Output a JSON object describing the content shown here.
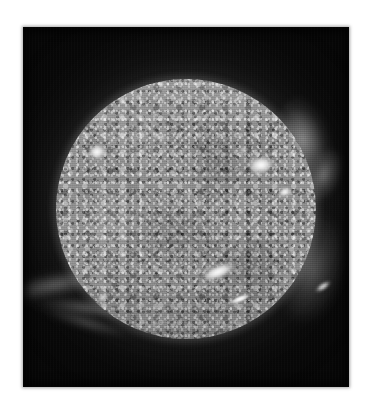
{
  "image": {
    "kind": "solar-disk-photograph",
    "subject": "Sun",
    "rendering": "grayscale",
    "caption": "",
    "frame": {
      "background_color": "#ffffff",
      "plate_color": "#060606",
      "left": 23,
      "top": 27,
      "width": 326,
      "height": 360
    },
    "disk": {
      "label": "solar disk",
      "center_x": 186,
      "center_y": 209,
      "radius": 130,
      "surface_color": "#8e8e8e",
      "limb_color": "#b4b4b4",
      "texture": "granular mottled plasma"
    },
    "corona": {
      "label": "corona",
      "glow_color": "#c8c8c8",
      "sky_color": "#0a0a0a"
    },
    "features": [
      {
        "name": "active-region-west",
        "label": "bright active region (west limb)",
        "x": 97,
        "y": 152,
        "brightness": "#ffffff"
      },
      {
        "name": "active-region-east",
        "label": "bright active region (east)",
        "x": 261,
        "y": 165,
        "brightness": "#ffffff"
      },
      {
        "name": "bright-filament-south",
        "label": "elongated bright filament (south central)",
        "x": 218,
        "y": 272,
        "brightness": "#ffffff"
      },
      {
        "name": "coronal-streamer-southwest",
        "label": "coronal streamer extending off the southwest limb",
        "x": 55,
        "y": 285,
        "brightness": "#b4b4b4"
      },
      {
        "name": "coronal-loop-northeast",
        "label": "coronal loop / prominence at the northeast limb",
        "x": 312,
        "y": 140,
        "brightness": "#dcdcdc"
      },
      {
        "name": "limb-brightening-southeast",
        "label": "limb brightening on the southeast edge",
        "x": 318,
        "y": 270,
        "brightness": "#c0c0c0"
      }
    ]
  }
}
